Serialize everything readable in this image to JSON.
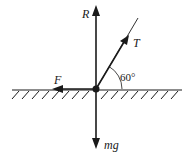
{
  "diagram": {
    "type": "free-body-diagram",
    "forces": [
      {
        "id": "R",
        "label": "R",
        "direction": "up"
      },
      {
        "id": "T",
        "label": "T",
        "direction": "up-right",
        "angle_deg": 60
      },
      {
        "id": "F",
        "label": "F",
        "direction": "left"
      },
      {
        "id": "mg",
        "label": "mg",
        "direction": "down"
      }
    ],
    "angle_label": "60°",
    "surface": "rough horizontal ground",
    "colors": {
      "ink": "#1a1a1a",
      "background": "#ffffff"
    }
  }
}
